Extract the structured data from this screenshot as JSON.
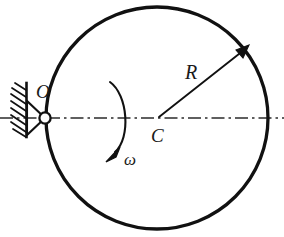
{
  "figure": {
    "type": "mechanics-diagram",
    "background_color": "#ffffff",
    "line_color": "#111111",
    "labels": {
      "pivot": "O",
      "center": "C",
      "radius": "R",
      "angular_velocity": "ω"
    },
    "geometry": {
      "disk": {
        "center_x": 157,
        "center_y": 118,
        "radius": 111,
        "stroke_width": 3.2
      },
      "pin_joint": {
        "cx": 45,
        "cy": 118,
        "r": 5.6
      },
      "support_triangle": {
        "apex_x": 45,
        "apex_y": 118,
        "base_x": 27,
        "base_top_y": 101,
        "base_bottom_y": 135
      },
      "wall": {
        "x": 26,
        "y_top": 83,
        "y_bottom": 135,
        "hatch_count": 8
      },
      "centerline": {
        "x_start": 0,
        "x_end": 284,
        "y": 118,
        "dash_pattern": "12 4 2 4"
      },
      "radius_arrow": {
        "x1": 158,
        "y1": 118,
        "x2": 247,
        "y2": 47
      },
      "omega_arc": {
        "start_x": 110,
        "start_y": 82,
        "end_x": 111,
        "end_y": 153,
        "bulge_x": 132,
        "direction": "clockwise-to-lower-left"
      }
    }
  }
}
